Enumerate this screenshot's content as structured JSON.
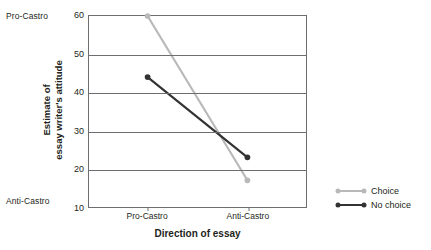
{
  "chart_data": {
    "type": "line",
    "title": "",
    "xlabel": "Direction of essay",
    "ylabel": "Estimate of essay writer's attitude",
    "ylabel_line1": "Estimate of",
    "ylabel_line2": "essay writer's attitude",
    "categories": [
      "Pro-Castro",
      "Anti-Castro"
    ],
    "series": [
      {
        "name": "Choice",
        "values": [
          60,
          17
        ],
        "color": "#b9b9b9"
      },
      {
        "name": "No choice",
        "values": [
          44,
          23
        ],
        "color": "#333333"
      }
    ],
    "ylim": [
      10,
      60
    ],
    "yticks": [
      60,
      50,
      40,
      30,
      20,
      10
    ],
    "ytick_labels": [
      "60",
      "50",
      "40",
      "30",
      "20",
      "10"
    ],
    "y_anchor_top": "Pro-Castro",
    "y_anchor_bottom": "Anti-Castro",
    "grid": true,
    "legend_position": "right"
  },
  "legend": {
    "entries": [
      {
        "label": "Choice",
        "color": "#b9b9b9"
      },
      {
        "label": "No choice",
        "color": "#333333"
      }
    ]
  }
}
